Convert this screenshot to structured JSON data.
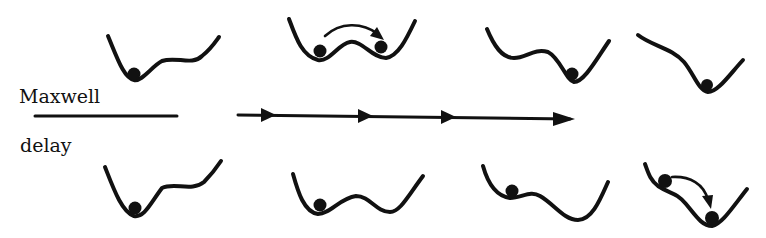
{
  "labels": {
    "maxwell": "Maxwell",
    "delay": "delay"
  },
  "rows": [
    {
      "name": "maxwell",
      "panels": [
        {
          "potential": "double-well-left-deep",
          "ball_positions": [
            "left-minimum"
          ],
          "transition": null
        },
        {
          "potential": "symmetric-double-well",
          "ball_positions": [
            "left-minimum",
            "right-minimum"
          ],
          "transition": "left-to-right"
        },
        {
          "potential": "double-well-right-deep",
          "ball_positions": [
            "right-minimum"
          ],
          "transition": null
        },
        {
          "potential": "single-well-right",
          "ball_positions": [
            "minimum"
          ],
          "transition": null
        }
      ]
    },
    {
      "name": "delay",
      "panels": [
        {
          "potential": "double-well-left-deep",
          "ball_positions": [
            "left-minimum"
          ],
          "transition": null
        },
        {
          "potential": "symmetric-double-well",
          "ball_positions": [
            "left-minimum"
          ],
          "transition": null
        },
        {
          "potential": "double-well-right-deep",
          "ball_positions": [
            "left-minimum"
          ],
          "transition": null
        },
        {
          "potential": "single-well-right-with-shoulder",
          "ball_positions": [
            "shoulder",
            "minimum"
          ],
          "transition": "shoulder-to-minimum"
        }
      ]
    }
  ],
  "parameter_axis": {
    "arrowheads": 4,
    "direction": "right"
  },
  "colors": {
    "ink": "#111111",
    "background": "#ffffff"
  }
}
